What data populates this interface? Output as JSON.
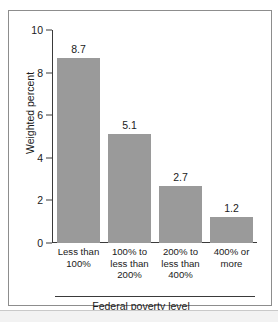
{
  "chart_data": {
    "type": "bar",
    "title": "",
    "subtitle": "",
    "categories": [
      "Less than\n100%",
      "100% to\nless than\n200%",
      "200% to\nless than\n400%",
      "400% or\nmore"
    ],
    "values": [
      8.7,
      5.1,
      2.7,
      1.2
    ],
    "data_labels": [
      "8.7",
      "5.1",
      "2.7",
      "1.2"
    ],
    "xlabel": "Federal poverty level",
    "ylabel": "Weighted percent",
    "ylim": [
      0,
      10
    ],
    "yticks": [
      0,
      2,
      4,
      6,
      8,
      10
    ],
    "ytick_labels": [
      "0",
      "2",
      "4",
      "6",
      "8",
      "10"
    ],
    "grid": false,
    "legend": null,
    "bar_color": "#9a9a9a",
    "axis_color": "#3a3a3a",
    "frame_color": "#8d8d8d",
    "text_color": "#1a1a1a"
  },
  "axes": {
    "y_title": "Weighted percent",
    "x_title": "Federal poverty level"
  },
  "categories_display": [
    {
      "line1": "Less than",
      "line2": "100%",
      "line3": ""
    },
    {
      "line1": "100% to",
      "line2": "less than",
      "line3": "200%"
    },
    {
      "line1": "200% to",
      "line2": "less than",
      "line3": "400%"
    },
    {
      "line1": "400% or",
      "line2": "more",
      "line3": ""
    }
  ]
}
